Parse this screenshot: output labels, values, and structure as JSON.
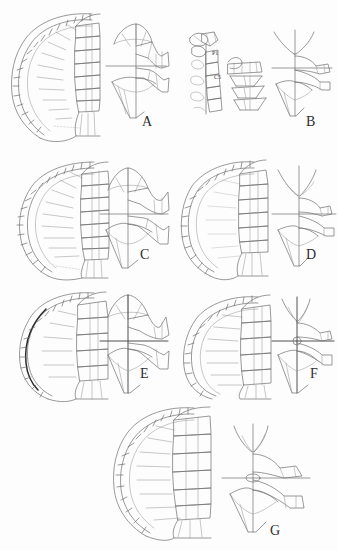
{
  "figure": {
    "kind": "scientific-plate",
    "background_color": "#fdfdfd",
    "line_color": "#6f6f6f",
    "accent_color": "#2a2a2a",
    "panel_count": 7
  },
  "panels": [
    {
      "id": "A",
      "letter": "A",
      "left_drawing": "carapace-dorsal-half",
      "right_drawing": "plastron-half",
      "labels": []
    },
    {
      "id": "B",
      "letter": "B",
      "left_drawing": "isolated-shell-elements",
      "right_drawing": "plastron-half",
      "labels": [
        {
          "text": "P1"
        },
        {
          "text": "C5"
        }
      ]
    },
    {
      "id": "C",
      "letter": "C",
      "left_drawing": "carapace-dorsal-half",
      "right_drawing": "plastron-half",
      "labels": []
    },
    {
      "id": "D",
      "letter": "D",
      "left_drawing": "carapace-dorsal-half",
      "right_drawing": "plastron-half",
      "labels": []
    },
    {
      "id": "E",
      "letter": "E",
      "left_drawing": "carapace-dorsal-half",
      "right_drawing": "plastron-half",
      "labels": []
    },
    {
      "id": "F",
      "letter": "F",
      "left_drawing": "carapace-dorsal-half",
      "right_drawing": "plastron-half",
      "labels": []
    },
    {
      "id": "G",
      "letter": "G",
      "left_drawing": "carapace-dorsal-half",
      "right_drawing": "plastron-half",
      "labels": []
    }
  ]
}
